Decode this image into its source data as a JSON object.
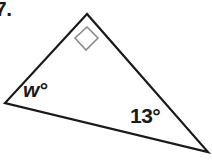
{
  "figure": {
    "type": "geometry-diagram",
    "shape": "right-triangle",
    "background_color": "#ffffff",
    "stroke_color": "#1a1a1a",
    "marker_color": "#8a8a8a",
    "text_color": "#1a1a1a",
    "item_number": "7.",
    "vertices": {
      "apex": {
        "x": 87,
        "y": 14
      },
      "left": {
        "x": 5,
        "y": 103
      },
      "bottom_right": {
        "x": 208,
        "y": 152
      }
    },
    "right_angle_marker": {
      "at": "apex",
      "points": "87,27 75,38 86,50 98,38"
    },
    "labels": {
      "unknown_angle": "w°",
      "known_angle": "13°"
    }
  }
}
